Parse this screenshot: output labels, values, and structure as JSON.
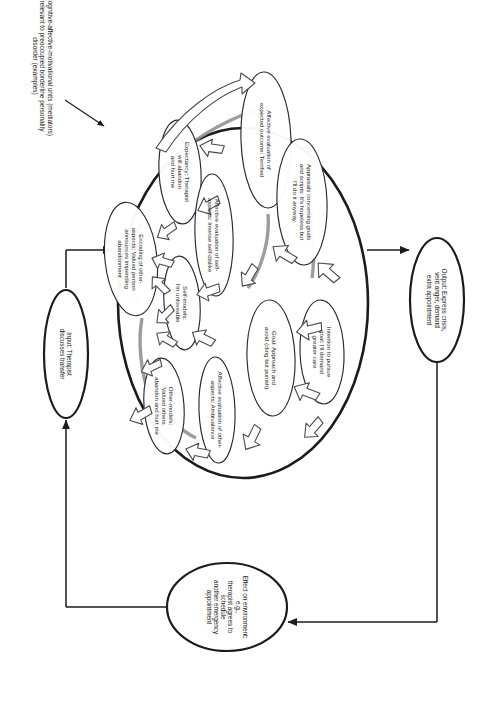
{
  "figure": {
    "title_caption": "Cognitive-affective-motivational units (mediators) relevant to preoccupied borderline personality disorder (examples)",
    "style": {
      "outline_color": "#1b1b1b",
      "text_color": "#1b1b1b",
      "background": "#ffffff",
      "arrow_fill": "#ffffff",
      "arrow_stroke": "#3a3a3a"
    }
  },
  "io_nodes": {
    "input": {
      "name": "input-node",
      "label": "Input: Therapist\ndiscusses transfer"
    },
    "output": {
      "name": "output-node",
      "label": "Output: Express crisis,\nvent anger, demand\nextra appointment"
    },
    "effect": {
      "name": "effect-node",
      "label": "Effect on environment: e.g.,\ntherapist agrees to schedule\nanother emergency appointment"
    }
  },
  "mediator_units": [
    {
      "id": "encoding-other",
      "label": "Encoding of other-\naspects: Valued person\nannounces impending\nabandonment"
    },
    {
      "id": "expectancy",
      "label": "Expectancy: Therapist\nwill abandon\nand hurt me"
    },
    {
      "id": "self-models",
      "label": "Self-models:\nI'm unloveable"
    },
    {
      "id": "other-models",
      "label": "Other-models:\nValued others\nabandon and hurt me"
    },
    {
      "id": "affective-eval-self",
      "label": "Affective evaluation of self-\naspects: Intense self-dislike"
    },
    {
      "id": "affective-eval-other",
      "label": "Affective evaluation of other-\naspects: Ambivalence"
    },
    {
      "id": "affective-eval-outcome",
      "label": "Affective evaluation of\nexpected outcome: Terrified"
    },
    {
      "id": "appraisals",
      "label": "Appraisals concerning goals\nand scripts: It's hopeless but\nI'll do it anyway."
    },
    {
      "id": "goal",
      "label": "Goal: Approach and\navoid (cling but punish)"
    },
    {
      "id": "intention",
      "label": "Intention to pursue\ngoal: I'll demand\ngreater care"
    }
  ],
  "connectors": [
    {
      "id": "input-to-system",
      "from": "input-node",
      "to": "mediator-system",
      "kind": "line-arrow"
    },
    {
      "id": "system-to-output",
      "from": "mediator-system",
      "to": "output-node",
      "kind": "line-arrow"
    },
    {
      "id": "output-to-effect",
      "from": "output-node",
      "to": "effect-node",
      "kind": "line-arrow"
    },
    {
      "id": "effect-to-input",
      "from": "effect-node",
      "to": "input-node",
      "kind": "line-arrow"
    },
    {
      "id": "caption-pointer",
      "from": "caption",
      "to": "mediator-system",
      "kind": "line-arrow"
    }
  ]
}
